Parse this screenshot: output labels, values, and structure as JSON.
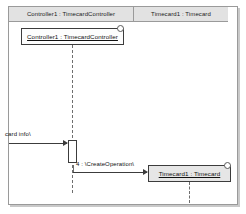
{
  "diagram": {
    "type": "uml-sequence-diagram",
    "header": {
      "columns": [
        {
          "label": "Controller1 : TimecardController"
        },
        {
          "label": "Timecard1 : Timecard"
        }
      ]
    },
    "objects": [
      {
        "name": "controller",
        "label": "Controller1 : TimecardController",
        "selected": true,
        "fill": "#fdfdfd"
      },
      {
        "name": "timecard",
        "label": "Timecard1 : Timecard",
        "selected": true,
        "fill": "#e6e6e6"
      }
    ],
    "messages": [
      {
        "name": "card-info",
        "label": "card info\\",
        "style": "solid",
        "from": "actor-boundary",
        "to": "controller"
      },
      {
        "name": "create-operation",
        "label": "4 : \\CreateOperation\\",
        "style": "solid",
        "from": "controller",
        "to": "timecard"
      }
    ],
    "colors": {
      "frame_border": "#9a9a9a",
      "header_band": "#e2e2e2",
      "object_border": "#3c3c3c",
      "lifeline": "#6e6e6e",
      "timecard_fill": "#e6e6e6"
    }
  }
}
